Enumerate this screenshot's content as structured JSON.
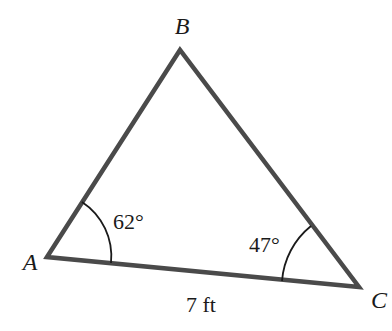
{
  "diagram": {
    "type": "triangle",
    "colors": {
      "stroke": "#4a4a4a",
      "arc": "#1a1a1a",
      "text": "#1a1a1a",
      "background": "#ffffff"
    },
    "vertices": {
      "A": {
        "label": "A",
        "x": 47,
        "y": 257
      },
      "B": {
        "label": "B",
        "x": 180,
        "y": 50
      },
      "C": {
        "label": "C",
        "x": 359,
        "y": 287
      }
    },
    "angles": {
      "A": {
        "label": "62°",
        "value": 62,
        "unit": "degrees"
      },
      "C": {
        "label": "47°",
        "value": 47,
        "unit": "degrees"
      }
    },
    "sides": {
      "AC": {
        "label": "7 ft",
        "value": 7,
        "unit": "ft"
      }
    }
  }
}
